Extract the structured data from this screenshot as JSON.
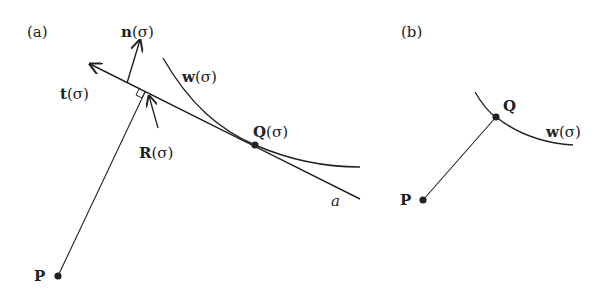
{
  "panel_a": {
    "label": "(a)",
    "normal_bold": "n",
    "normal_arg": "(σ)",
    "tangent_bold": "t",
    "tangent_arg": "(σ)",
    "curve_bold": "w",
    "curve_arg": "(σ)",
    "foot_bold": "R",
    "foot_arg": "(σ)",
    "contact_bold": "Q",
    "contact_arg": "(σ)",
    "line_label": "a",
    "point_label": "P"
  },
  "panel_b": {
    "label": "(b)",
    "contact_label": "Q",
    "curve_bold": "w",
    "curve_arg": "(σ)",
    "point_label": "P"
  },
  "colors": {
    "ink": "#222222",
    "background": "#ffffff"
  }
}
